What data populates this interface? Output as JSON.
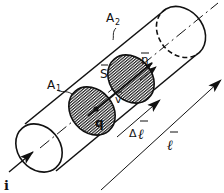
{
  "diagram": {
    "colors": {
      "ink": "#111111",
      "background": "#ffffff",
      "hatch": "#111111"
    },
    "labels": {
      "A1": "A",
      "A1_sub": "1",
      "A2": "A",
      "A2_sub": "2",
      "S": "S",
      "n": "n",
      "v": "v",
      "q": "q",
      "i": "i",
      "delta_l_prefix": "Δ",
      "delta_l": "ℓ",
      "l": "ℓ"
    },
    "elements": [
      {
        "id": "cylinder",
        "kind": "conductor cylinder"
      },
      {
        "id": "disk-A1",
        "kind": "hatched cross-section A1"
      },
      {
        "id": "disk-A2",
        "kind": "hatched cross-section A2"
      },
      {
        "id": "arrow-i",
        "kind": "current arrow"
      },
      {
        "id": "arrow-delta-l",
        "kind": "displacement vector Δℓ"
      },
      {
        "id": "arrow-l",
        "kind": "length vector ℓ"
      }
    ]
  }
}
